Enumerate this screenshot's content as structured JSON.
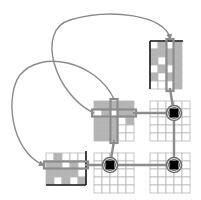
{
  "diagram": {
    "title": "",
    "colors": {
      "background": "#ffffff",
      "grid_line": "#b8b8b8",
      "cell_filled": "#b4b4b4",
      "cell_empty": "#ffffff",
      "border_dark": "#1a1a1a",
      "highlight_path": "#8c8c8c",
      "arrow": "#8a8a8a",
      "node_fill": "#000000",
      "node_ring": "#707070"
    },
    "blocks": [
      {
        "id": "top-right-block",
        "rows": 6,
        "cols": 4,
        "pattern": [
          [
            0,
            1,
            0,
            1
          ],
          [
            1,
            1,
            1,
            1
          ],
          [
            1,
            0,
            1,
            1
          ],
          [
            0,
            1,
            0,
            1
          ],
          [
            1,
            0,
            1,
            1
          ],
          [
            0,
            0,
            0,
            1
          ]
        ],
        "highlight_col": 2
      },
      {
        "id": "center-block",
        "rows": 5,
        "cols": 5,
        "pattern": [
          [
            1,
            1,
            1,
            1,
            1
          ],
          [
            0,
            1,
            0,
            1,
            1
          ],
          [
            1,
            1,
            1,
            0,
            1
          ],
          [
            1,
            1,
            1,
            0,
            0
          ],
          [
            1,
            1,
            1,
            0,
            0
          ]
        ],
        "highlight_row": 1,
        "highlight_col": 2
      },
      {
        "id": "left-block",
        "rows": 4,
        "cols": 5,
        "pattern": [
          [
            0,
            1,
            0,
            0,
            0
          ],
          [
            1,
            1,
            0,
            1,
            0
          ],
          [
            1,
            1,
            1,
            1,
            0
          ],
          [
            1,
            0,
            1,
            0,
            1
          ]
        ],
        "highlight_row": 1
      },
      {
        "id": "right-middle-block",
        "rows": 5,
        "cols": 5,
        "pattern": [],
        "node": {
          "row": 1,
          "col": 2
        }
      },
      {
        "id": "bottom-center-block",
        "rows": 5,
        "cols": 5,
        "pattern": [],
        "node": {
          "row": 1,
          "col": 1
        }
      },
      {
        "id": "bottom-right-block",
        "rows": 5,
        "cols": 5,
        "pattern": [],
        "node": {
          "row": 1,
          "col": 2
        }
      }
    ],
    "arrows": [
      {
        "id": "arrow-center-to-top-right",
        "from": "center-block",
        "to": "top-right-block"
      },
      {
        "id": "arrow-center-to-left",
        "from": "center-block",
        "to": "left-block"
      }
    ],
    "connections": [
      {
        "id": "link-center-to-right-middle",
        "from": "center-block",
        "to": "right-middle-block"
      },
      {
        "id": "link-top-right-to-right-middle",
        "from": "top-right-block",
        "to": "right-middle-block"
      },
      {
        "id": "link-right-middle-to-bottom-right",
        "from": "right-middle-block",
        "to": "bottom-right-block"
      },
      {
        "id": "link-center-to-bottom-center",
        "from": "center-block",
        "to": "bottom-center-block"
      },
      {
        "id": "link-bottom-center-to-bottom-right",
        "from": "bottom-center-block",
        "to": "bottom-right-block"
      },
      {
        "id": "link-left-to-bottom-center",
        "from": "left-block",
        "to": "bottom-center-block"
      }
    ]
  }
}
